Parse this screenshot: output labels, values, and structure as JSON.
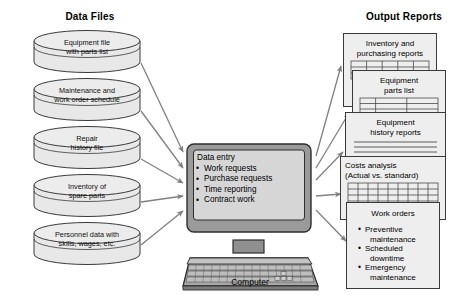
{
  "headings": {
    "data_files": "Data Files",
    "output_reports": "Output Reports"
  },
  "colors": {
    "page_background": "#ffffff",
    "cylinder_fill": "#e8e8e8",
    "cylinder_stroke": "#3a3a3a",
    "card_fill": "#eeeeee",
    "card_stroke": "#3a3a3a",
    "monitor_bezel": "#9a9a9a",
    "monitor_screen": "#d6d6d6",
    "keyboard_body": "#9a9a9a",
    "arrow_stroke": "#808080"
  },
  "data_files": [
    {
      "id": "equipment-file",
      "lines": [
        "Equipment file",
        "with parts list"
      ]
    },
    {
      "id": "maintenance-schedule",
      "lines": [
        "Maintenance and",
        "work order schedule"
      ]
    },
    {
      "id": "repair-history",
      "lines": [
        "Repair",
        "history file"
      ]
    },
    {
      "id": "inventory-spare-parts",
      "lines": [
        "Inventory of",
        "spare parts"
      ]
    },
    {
      "id": "personnel-data",
      "lines": [
        "Personnel data with",
        "skills, wages, etc."
      ]
    }
  ],
  "computer": {
    "caption": "Computer",
    "screen": {
      "heading": "Data entry",
      "items": [
        "Work requests",
        "Purchase requests",
        "Time reporting",
        "Contract work"
      ]
    }
  },
  "output_reports": [
    {
      "id": "inventory-purchasing",
      "title_lines": [
        "Inventory and",
        "purchasing reports"
      ],
      "body": "grid"
    },
    {
      "id": "equipment-parts-list",
      "title_lines": [
        "Equipment",
        "parts list"
      ],
      "body": "grid"
    },
    {
      "id": "equipment-history",
      "title_lines": [
        "Equipment",
        "history reports"
      ],
      "body": "rules"
    },
    {
      "id": "costs-analysis",
      "title_lines": [
        "Costs analysis",
        "(Actual vs. standard)"
      ],
      "body": "grid",
      "align": "left"
    },
    {
      "id": "work-orders",
      "title_lines": [
        "Work orders"
      ],
      "body": "list",
      "list": [
        {
          "lead": "Preventive",
          "cont": "maintenance"
        },
        {
          "lead": "Scheduled",
          "cont": "downtime"
        },
        {
          "lead": "Emergency",
          "cont": "maintenance"
        }
      ]
    }
  ]
}
